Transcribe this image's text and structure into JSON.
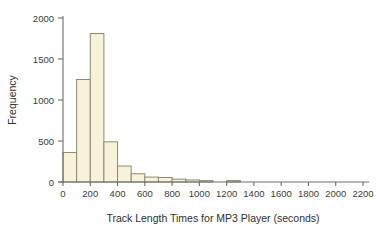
{
  "chart_data": {
    "type": "bar",
    "title": "",
    "xlabel": "Track Length Times for MP3 Player (seconds)",
    "ylabel": "Frequency",
    "xlim": [
      0,
      2200
    ],
    "ylim": [
      0,
      2000
    ],
    "grid": false,
    "legend": null,
    "bin_width": 100,
    "xticks": [
      0,
      200,
      400,
      600,
      800,
      1000,
      1200,
      1400,
      1600,
      1800,
      2000,
      2200
    ],
    "xtick_labels": [
      "0",
      "200",
      "400",
      "600",
      "800",
      "1000",
      "1200",
      "1400",
      "1600",
      "1800",
      "2000",
      "2200"
    ],
    "yticks": [
      0,
      500,
      1000,
      1500,
      2000
    ],
    "ytick_labels": [
      "0",
      "500",
      "1000",
      "1500",
      "2000"
    ],
    "bin_edges": [
      0,
      100,
      200,
      300,
      400,
      500,
      600,
      700,
      800,
      900,
      1000,
      1100,
      1200,
      1300
    ],
    "categories": [
      "0-100",
      "100-200",
      "200-300",
      "300-400",
      "400-500",
      "500-600",
      "600-700",
      "700-800",
      "800-900",
      "900-1000",
      "1000-1100",
      "1100-1200",
      "1200-1300"
    ],
    "values": [
      360,
      1250,
      1810,
      490,
      195,
      100,
      60,
      55,
      35,
      25,
      15,
      0,
      15
    ],
    "bar_fill": "#f7f2d8",
    "bar_edge": "#8a8a72",
    "axis_color": "#6d6d68",
    "text_color": "#3c3c3c"
  },
  "figure": {
    "background": "#ffffff"
  }
}
